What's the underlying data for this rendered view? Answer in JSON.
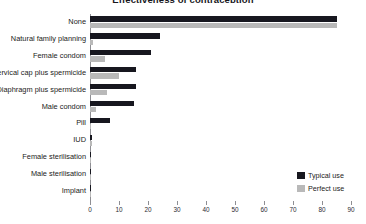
{
  "chart_data": {
    "type": "bar",
    "orientation": "horizontal",
    "title": "Effectiveness of contraception",
    "xlabel": "",
    "ylabel": "",
    "xlim": [
      0,
      90
    ],
    "xticks": [
      0,
      10,
      20,
      30,
      40,
      50,
      60,
      70,
      80,
      90
    ],
    "grid": false,
    "legend_position": "bottom-right",
    "categories": [
      "None",
      "Natural family planning",
      "Female condom",
      "Cervical cap plus spermicide",
      "Diaphragm plus spermicide",
      "Male condom",
      "Pill",
      "IUD",
      "Female sterilisation",
      "Male sterilisation",
      "Implant"
    ],
    "series": [
      {
        "name": "Typical use",
        "color": "#17171f",
        "values": [
          85,
          24,
          21,
          16,
          16,
          15,
          7,
          0.8,
          0.5,
          0.15,
          0.05
        ]
      },
      {
        "name": "Perfect use",
        "color": "#b9b9b9",
        "values": [
          85,
          1,
          5,
          10,
          6,
          2,
          0.3,
          0.6,
          0.5,
          0.1,
          0.05
        ]
      }
    ]
  },
  "legend": {
    "items": [
      {
        "label": "Typical use",
        "color": "#17171f"
      },
      {
        "label": "Perfect use",
        "color": "#b9b9b9"
      }
    ]
  },
  "colors": {
    "typical_use": "#17171f",
    "perfect_use": "#b9b9b9",
    "axis": "#8e8e93",
    "text": "#1b1b20",
    "background": "#ffffff"
  }
}
